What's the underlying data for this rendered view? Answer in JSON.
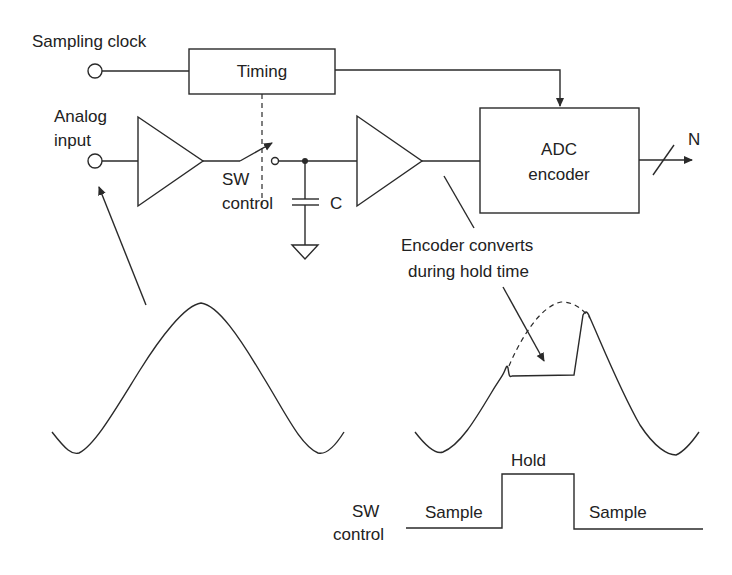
{
  "diagram": {
    "labels": {
      "sampling_clock": "Sampling clock",
      "timing": "Timing",
      "analog_line1": "Analog",
      "analog_line2": "input",
      "sw_line1": "SW",
      "sw_line2": "control",
      "capacitor": "C",
      "adc_line1": "ADC",
      "adc_line2": "encoder",
      "output_bits": "N",
      "encoder_note_line1": "Encoder converts",
      "encoder_note_line2": "during hold time",
      "hold": "Hold",
      "sample_left": "Sample",
      "sample_right": "Sample",
      "sw_ctrl_line1": "SW",
      "sw_ctrl_line2": "control"
    },
    "colors": {
      "line": "#2a2a2a",
      "text": "#222222",
      "background": "#ffffff"
    }
  }
}
